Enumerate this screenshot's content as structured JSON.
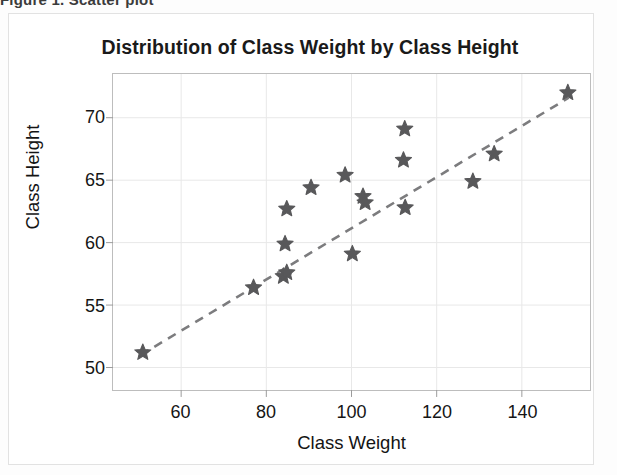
{
  "ghost_line": "Figure 1. Scatter plot",
  "chart_data": {
    "type": "scatter",
    "title": "Distribution of Class Weight by Class Height",
    "xlabel": "Class Weight",
    "ylabel": "Class Height",
    "xlim": [
      44,
      156
    ],
    "ylim": [
      48.2,
      73.5
    ],
    "xticks": [
      60,
      80,
      100,
      120,
      140
    ],
    "yticks": [
      50,
      55,
      60,
      65,
      70
    ],
    "xtick_labels": [
      "60",
      "80",
      "100",
      "120",
      "140"
    ],
    "ytick_labels": [
      "50",
      "55",
      "60",
      "65",
      "70"
    ],
    "grid": true,
    "grid_color": "#e8e8e8",
    "legend": null,
    "marker": "star",
    "marker_color": "#58585a",
    "marker_size": 17,
    "points": [
      {
        "x": 51,
        "y": 51.2
      },
      {
        "x": 77,
        "y": 56.4
      },
      {
        "x": 84,
        "y": 57.3
      },
      {
        "x": 84.8,
        "y": 57.6
      },
      {
        "x": 84.4,
        "y": 59.9
      },
      {
        "x": 84.8,
        "y": 62.7
      },
      {
        "x": 90.5,
        "y": 64.4
      },
      {
        "x": 98.5,
        "y": 65.4
      },
      {
        "x": 100.2,
        "y": 59.1
      },
      {
        "x": 102.7,
        "y": 63.7
      },
      {
        "x": 103.2,
        "y": 63.2
      },
      {
        "x": 112.5,
        "y": 69.1
      },
      {
        "x": 112.2,
        "y": 66.6
      },
      {
        "x": 112.6,
        "y": 62.8
      },
      {
        "x": 128.5,
        "y": 64.9
      },
      {
        "x": 133.5,
        "y": 67.1
      },
      {
        "x": 150.8,
        "y": 72.0
      }
    ],
    "trendline": {
      "style": "dashed",
      "color": "#7c7c7e",
      "x_start": 50.5,
      "y_start": 51.0,
      "x_end": 151.0,
      "y_end": 71.6
    }
  }
}
